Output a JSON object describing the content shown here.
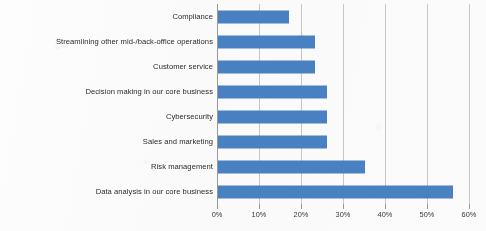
{
  "chart_data": {
    "type": "bar",
    "orientation": "horizontal",
    "title": "",
    "subtitle": "",
    "xlabel": "",
    "ylabel": "",
    "xlim": [
      0,
      60
    ],
    "xtick_values": [
      0,
      10,
      20,
      30,
      40,
      50,
      60
    ],
    "xtick_labels": [
      "0%",
      "10%",
      "20%",
      "30%",
      "40%",
      "50%",
      "60%"
    ],
    "grid": true,
    "legend": false,
    "legend_position": "none",
    "series_color": "#4a82c4",
    "categories": [
      "Compliance",
      "Streamlining other mid-/back-office operations",
      "Customer service",
      "Decision making in our core business",
      "Cybersecurity",
      "Sales and marketing",
      "Risk management",
      "Data analysis in our core business"
    ],
    "values": [
      17,
      23,
      23,
      26,
      26,
      26,
      35,
      56
    ],
    "value_unit": "%"
  },
  "colors": {
    "bar": "#4a82c4",
    "gridline": "#c9c9c9",
    "axis": "#9a9a9a",
    "label_text": "#2b2b2b",
    "tick_text": "#3a3a3a",
    "background": "#fdfdfd"
  }
}
